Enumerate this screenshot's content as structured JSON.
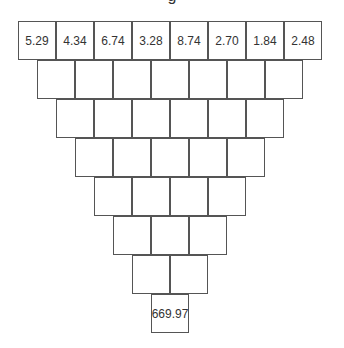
{
  "title": "g",
  "pyramid": {
    "rows": [
      [
        "5.29",
        "4.34",
        "6.74",
        "3.28",
        "8.74",
        "2.70",
        "1.84",
        "2.48"
      ],
      [
        "",
        "",
        "",
        "",
        "",
        "",
        ""
      ],
      [
        "",
        "",
        "",
        "",
        "",
        ""
      ],
      [
        "",
        "",
        "",
        "",
        ""
      ],
      [
        "",
        "",
        "",
        ""
      ],
      [
        "",
        "",
        ""
      ],
      [
        "",
        ""
      ],
      [
        "669.97"
      ]
    ],
    "border_color": "#555555"
  }
}
